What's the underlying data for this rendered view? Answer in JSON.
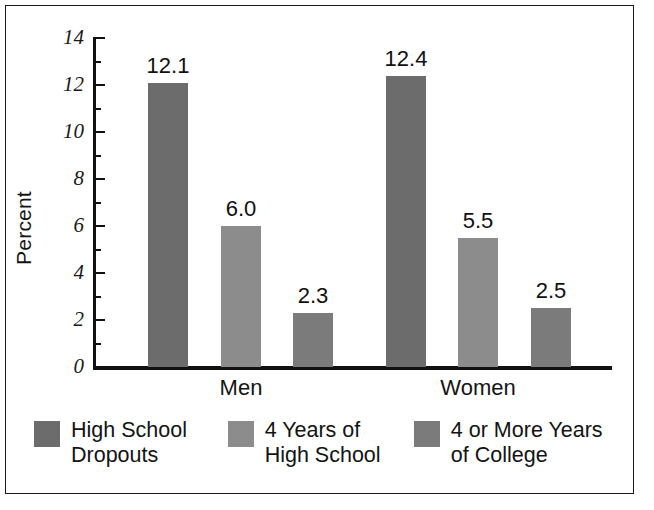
{
  "chart_data": {
    "type": "bar",
    "title": "",
    "subtitle": "",
    "xlabel": "",
    "ylabel": "Percent",
    "ylim": [
      0,
      14
    ],
    "yticks": [
      0,
      2,
      4,
      6,
      8,
      10,
      12,
      14
    ],
    "ytick_labels": [
      "0",
      "2",
      "4",
      "6",
      "8",
      "10",
      "12",
      "14"
    ],
    "minor_ticks": [
      1,
      3,
      5,
      7,
      9,
      11,
      13
    ],
    "grid": false,
    "legend_position": "bottom",
    "categories": [
      "Men",
      "Women"
    ],
    "series": [
      {
        "name": "High School Dropouts",
        "legend_label": "High School\nDropouts",
        "color": "#6c6c6c",
        "values": [
          12.1,
          12.4
        ],
        "value_labels": [
          "12.1",
          "12.4"
        ]
      },
      {
        "name": "4 Years of High School",
        "legend_label": "4 Years of\nHigh School",
        "color": "#8c8c8c",
        "values": [
          6.0,
          5.5
        ],
        "value_labels": [
          "6.0",
          "5.5"
        ]
      },
      {
        "name": "4 or More Years of College",
        "legend_label": "4 or More Years\nof College",
        "color": "#7b7b7b",
        "values": [
          2.3,
          2.5
        ],
        "value_labels": [
          "2.3",
          "2.5"
        ]
      }
    ],
    "bars": [
      {
        "group": "Men",
        "series": "High School Dropouts",
        "value": 12.1,
        "label": "12.1",
        "color": "#6c6c6c",
        "x": 148,
        "width": 40
      },
      {
        "group": "Men",
        "series": "4 Years of High School",
        "value": 6.0,
        "label": "6.0",
        "color": "#8c8c8c",
        "x": 221,
        "width": 40
      },
      {
        "group": "Men",
        "series": "4 or More Years of College",
        "value": 2.3,
        "label": "2.3",
        "color": "#7b7b7b",
        "x": 293,
        "width": 40
      },
      {
        "group": "Women",
        "series": "High School Dropouts",
        "value": 12.4,
        "label": "12.4",
        "color": "#6c6c6c",
        "x": 386,
        "width": 40
      },
      {
        "group": "Women",
        "series": "4 Years of High School",
        "value": 5.5,
        "label": "5.5",
        "color": "#8c8c8c",
        "x": 458,
        "width": 40
      },
      {
        "group": "Women",
        "series": "4 or More Years of College",
        "value": 2.5,
        "label": "2.5",
        "color": "#7b7b7b",
        "x": 531,
        "width": 40
      }
    ],
    "group_label_x": [
      241,
      478
    ]
  },
  "colors": {
    "background": "#ffffff",
    "frame": "#1a1a1a",
    "axis": "#111111",
    "text": "#131313",
    "series_dark": "#6c6c6c",
    "series_light": "#8c8c8c",
    "series_medium": "#7b7b7b"
  }
}
